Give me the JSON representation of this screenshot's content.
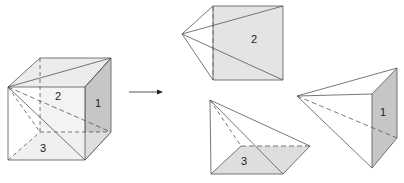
{
  "figure": {
    "colors": {
      "line": "#555555",
      "face_light": "#e4e4e4",
      "face_top": "#e8e8e8",
      "face_dark": "#c6c6c6",
      "face_base": "#dedede",
      "background": "#ffffff"
    },
    "cube": {
      "labels": {
        "face1": "1",
        "face2": "2",
        "face3": "3"
      }
    },
    "arrow": {
      "label": ""
    },
    "pieces": [
      {
        "id": "pyramid-2",
        "label": "2"
      },
      {
        "id": "pyramid-3",
        "label": "3"
      },
      {
        "id": "pyramid-1",
        "label": "1"
      }
    ]
  }
}
